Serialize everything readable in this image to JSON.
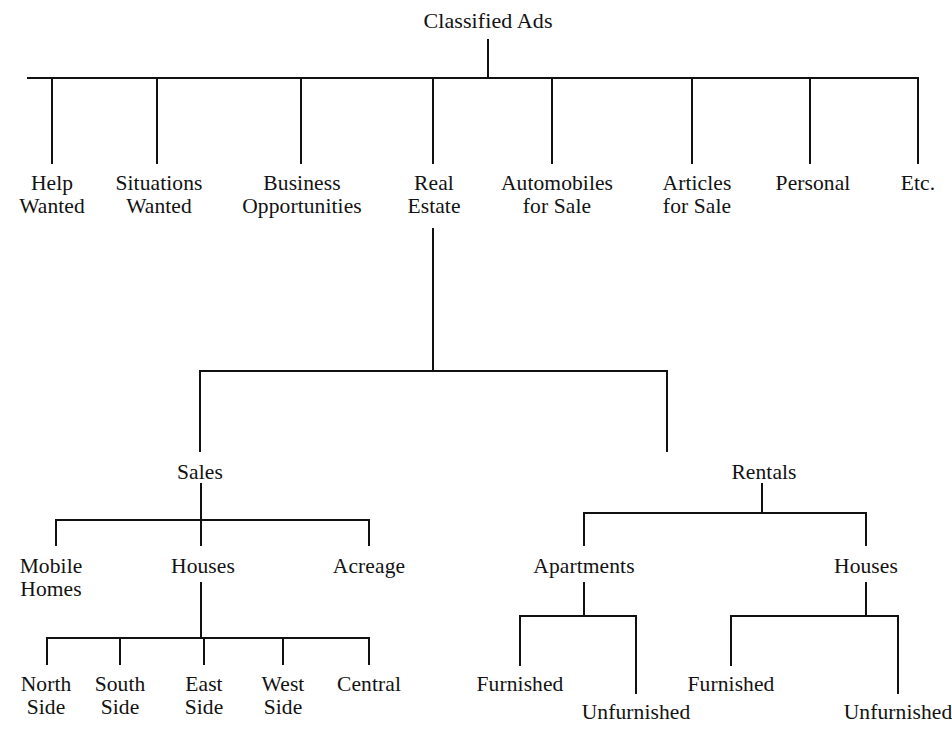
{
  "diagram": {
    "type": "hierarchical-tree",
    "title": "Classified Ads",
    "orientation": "top-down",
    "line_color": "#111111",
    "text_color": "#121212",
    "background_color": "#ffffff",
    "root": {
      "label": "Classified Ads",
      "children": [
        {
          "label_line1": "Help",
          "label_line2": "Wanted"
        },
        {
          "label_line1": "Situations",
          "label_line2": "Wanted"
        },
        {
          "label_line1": "Business",
          "label_line2": "Opportunities"
        },
        {
          "label_line1": "Real",
          "label_line2": "Estate",
          "children": [
            {
              "label_line1": "Sales",
              "children": [
                {
                  "label_line1": "Mobile",
                  "label_line2": "Homes"
                },
                {
                  "label_line1": "Houses",
                  "children": [
                    {
                      "label_line1": "North",
                      "label_line2": "Side"
                    },
                    {
                      "label_line1": "South",
                      "label_line2": "Side"
                    },
                    {
                      "label_line1": "East",
                      "label_line2": "Side"
                    },
                    {
                      "label_line1": "West",
                      "label_line2": "Side"
                    },
                    {
                      "label_line1": "Central",
                      "label_line2": ""
                    }
                  ]
                },
                {
                  "label_line1": "Acreage",
                  "label_line2": ""
                }
              ]
            },
            {
              "label_line1": "Rentals",
              "children": [
                {
                  "label_line1": "Apartments",
                  "children": [
                    {
                      "label_line1": "Furnished"
                    },
                    {
                      "label_line1": "Unfurnished"
                    }
                  ]
                },
                {
                  "label_line1": "Houses",
                  "children": [
                    {
                      "label_line1": "Furnished"
                    },
                    {
                      "label_line1": "Unfurnished"
                    }
                  ]
                }
              ]
            }
          ]
        },
        {
          "label_line1": "Automobiles",
          "label_line2": "for Sale"
        },
        {
          "label_line1": "Articles",
          "label_line2": "for Sale"
        },
        {
          "label_line1": "Personal",
          "label_line2": ""
        },
        {
          "label_line1": "Etc.",
          "label_line2": ""
        }
      ]
    },
    "labels": {
      "root": "Classified Ads",
      "help": "Help",
      "help2": "Wanted",
      "situations": "Situations",
      "situations2": "Wanted",
      "business": "Business",
      "business2": "Opportunities",
      "real": "Real",
      "real2": "Estate",
      "automobiles": "Automobiles",
      "automobiles2": "for Sale",
      "articles": "Articles",
      "articles2": "for Sale",
      "personal": "Personal",
      "etc": "Etc.",
      "sales": "Sales",
      "rentals": "Rentals",
      "mobile": "Mobile",
      "mobile2": "Homes",
      "houses_sales": "Houses",
      "acreage": "Acreage",
      "north": "North",
      "north2": "Side",
      "south": "South",
      "south2": "Side",
      "east": "East",
      "east2": "Side",
      "west": "West",
      "west2": "Side",
      "central": "Central",
      "apartments": "Apartments",
      "houses_rentals": "Houses",
      "apt_furnished": "Furnished",
      "apt_unfurnished": "Unfurnished",
      "house_furnished": "Furnished",
      "house_unfurnished": "Unfurnished"
    }
  }
}
